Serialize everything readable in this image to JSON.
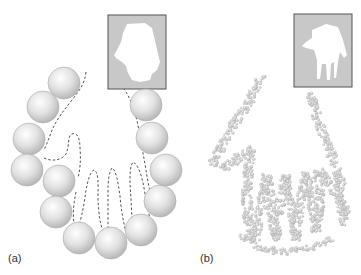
{
  "figure": {
    "panels": [
      {
        "label": "(a)",
        "description": "Large spherical particles arranged around a dashed hand-shaped contour; inset shows a coarse hand silhouette",
        "inset_fill": "#c8c8c8",
        "inset_shape_fill": "#ffffff"
      },
      {
        "label": "(b)",
        "description": "Many small particles densely packed around a hand-shaped cavity; inset shows a detailed hand silhouette",
        "inset_fill": "#c8c8c8",
        "inset_shape_fill": "#ffffff"
      }
    ],
    "colors": {
      "sphere": "#d9d9d9",
      "sphere_edge": "#b5b5b5",
      "dashed_contour": "#555555",
      "small_particle": "#c4c4c4",
      "inset_border": "#555555"
    }
  }
}
